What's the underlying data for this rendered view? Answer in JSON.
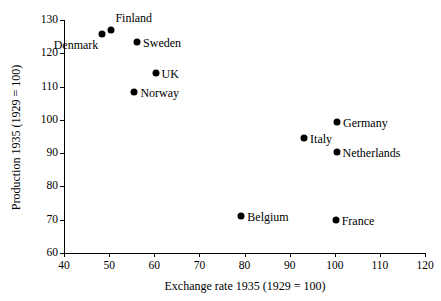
{
  "chart_data": {
    "type": "scatter",
    "title": "",
    "xlabel": "Exchange rate 1935 (1929 = 100)",
    "ylabel": "Production 1935 (1929 = 100)",
    "xlim": [
      40,
      120
    ],
    "ylim": [
      60,
      130
    ],
    "xticks": [
      40,
      50,
      60,
      70,
      80,
      90,
      100,
      110,
      120
    ],
    "yticks": [
      60,
      70,
      80,
      90,
      100,
      110,
      120,
      130
    ],
    "grid": false,
    "legend": "none",
    "marker_color": "#000000",
    "points": [
      {
        "label": "Denmark",
        "x": 48.5,
        "y": 125.7,
        "label_pos": "belowleft"
      },
      {
        "label": "Finland",
        "x": 50.5,
        "y": 127.1,
        "label_pos": "above"
      },
      {
        "label": "Sweden",
        "x": 56.2,
        "y": 123.4,
        "label_pos": "right"
      },
      {
        "label": "UK",
        "x": 60.3,
        "y": 114.2,
        "label_pos": "right"
      },
      {
        "label": "Norway",
        "x": 55.6,
        "y": 108.3,
        "label_pos": "right"
      },
      {
        "label": "Germany",
        "x": 100.5,
        "y": 99.5,
        "label_pos": "right"
      },
      {
        "label": "Italy",
        "x": 93.2,
        "y": 94.6,
        "label_pos": "right"
      },
      {
        "label": "Netherlands",
        "x": 100.4,
        "y": 90.3,
        "label_pos": "right"
      },
      {
        "label": "Belgium",
        "x": 79.3,
        "y": 71.1,
        "label_pos": "right"
      },
      {
        "label": "France",
        "x": 100.2,
        "y": 69.9,
        "label_pos": "right"
      }
    ]
  }
}
